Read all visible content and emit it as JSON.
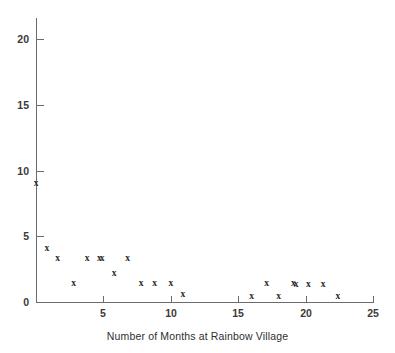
{
  "chart_data": {
    "type": "scatter",
    "title": "",
    "xlabel": "Number of Months at Rainbow Village",
    "ylabel": "",
    "xlim": [
      0,
      25
    ],
    "ylim": [
      0,
      21.7
    ],
    "grid": false,
    "legend": null,
    "marker": "x",
    "marker_color": "#2b2b2b",
    "axis_color": "#6b6b6b",
    "x_ticks": [
      0,
      5,
      10,
      15,
      20,
      25
    ],
    "x_tick_labels": [
      "",
      "5",
      "10",
      "15",
      "20",
      "25"
    ],
    "y_ticks": [
      0,
      5,
      10,
      15,
      20
    ],
    "y_tick_labels": [
      "0",
      "5",
      "10",
      "15",
      "20"
    ],
    "points": [
      {
        "x": 0.0,
        "y": 9.0
      },
      {
        "x": 0.8,
        "y": 4.1
      },
      {
        "x": 1.6,
        "y": 3.3
      },
      {
        "x": 2.8,
        "y": 1.4
      },
      {
        "x": 3.8,
        "y": 3.3
      },
      {
        "x": 4.7,
        "y": 3.3
      },
      {
        "x": 4.9,
        "y": 3.3
      },
      {
        "x": 5.8,
        "y": 2.2
      },
      {
        "x": 6.8,
        "y": 3.3
      },
      {
        "x": 7.8,
        "y": 1.4
      },
      {
        "x": 8.8,
        "y": 1.4
      },
      {
        "x": 10.0,
        "y": 1.4
      },
      {
        "x": 10.9,
        "y": 0.6
      },
      {
        "x": 16.0,
        "y": 0.45
      },
      {
        "x": 17.1,
        "y": 1.4
      },
      {
        "x": 18.0,
        "y": 0.45
      },
      {
        "x": 19.1,
        "y": 1.4
      },
      {
        "x": 19.3,
        "y": 1.3
      },
      {
        "x": 20.2,
        "y": 1.3
      },
      {
        "x": 21.3,
        "y": 1.3
      },
      {
        "x": 22.4,
        "y": 0.45
      }
    ]
  }
}
